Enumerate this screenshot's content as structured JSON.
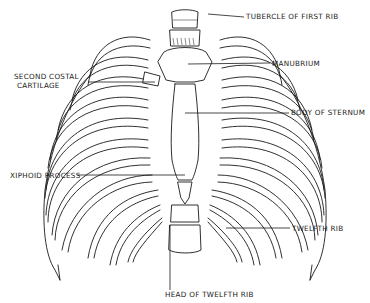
{
  "figure": {
    "line_color": "#1a1a1a",
    "background": "#ffffff"
  },
  "labels": {
    "tubercle_first_rib": "TUBERCLE OF FIRST RIB",
    "manubrium": "MANUBRIUM",
    "second_costal_cartilage_line1": "SECOND COSTAL",
    "second_costal_cartilage_line2": "CARTILAGE",
    "body_of_sternum": "BODY OF STERNUM",
    "xiphoid_process": "XIPHOID PROCESS",
    "twelfth_rib": "TWELFTH RIB",
    "head_of_twelfth_rib": "HEAD OF TWELFTH RIB"
  }
}
